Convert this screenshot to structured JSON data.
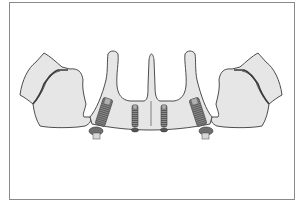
{
  "figure": {
    "caption": "",
    "components": [
      {
        "name": "left-zygomatic-bone",
        "label": "left bone segment"
      },
      {
        "name": "palatal-arch",
        "label": "maxilla / palate"
      },
      {
        "name": "right-zygomatic-bone",
        "label": "right bone segment"
      },
      {
        "name": "implant-left-tilted",
        "label": "posterior tilted implant (left)"
      },
      {
        "name": "implant-left-axial",
        "label": "anterior axial implant (left)"
      },
      {
        "name": "implant-right-axial",
        "label": "anterior axial implant (right)"
      },
      {
        "name": "implant-right-tilted",
        "label": "posterior tilted implant (right)"
      }
    ],
    "colors": {
      "bone_fill": "#e6e6e6",
      "bone_stroke": "#3a3a3a",
      "implant_fill": "#8c8c8c",
      "implant_dark": "#555555",
      "abutment_fill": "#d8d8d8",
      "frame": "#8a8a8a"
    }
  }
}
